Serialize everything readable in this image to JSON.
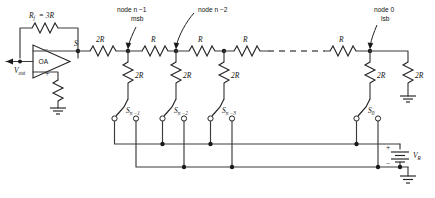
{
  "figure": {
    "type": "circuit-schematic",
    "labels": {
      "feedback_resistor": "R",
      "feedback_resistor_sub": "f",
      "feedback_value": "= 3R",
      "opamp": "OA",
      "opamp_inverting": "−",
      "opamp_noninverting": "+",
      "vout": "V",
      "vout_sub": "out",
      "summing_node": "S",
      "series_2R": "2R",
      "series_R": "R",
      "shunt_2R": "2R",
      "term_2R": "2R",
      "node_msb": "node n −1",
      "node_msb_2": "msb",
      "node_n2": "node n −2",
      "node_lsb": "node 0",
      "node_lsb_2": "lsb",
      "vref": "V",
      "vref_sub": "R",
      "battery_plus": "+",
      "battery_minus": "−"
    },
    "switches": [
      {
        "name": "S",
        "sub": "n −1"
      },
      {
        "name": "S",
        "sub": "n −2"
      },
      {
        "name": "S",
        "sub": "n −3"
      },
      {
        "name": "S",
        "sub": "0"
      }
    ],
    "ladder": {
      "series_resistors": [
        "2R",
        "R",
        "R",
        "R",
        "R"
      ],
      "shunt_resistors": [
        "2R",
        "2R",
        "2R",
        "2R"
      ],
      "terminating_resistor": "2R"
    },
    "colors": {
      "wire": "#3a3a3a",
      "ink": "#222222",
      "background": "#ffffff"
    }
  }
}
